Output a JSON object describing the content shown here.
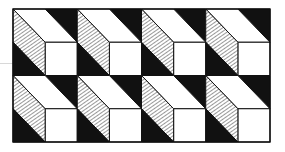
{
  "figure": {
    "grid": {
      "rows": 2,
      "cols": 4,
      "origin_x": 13,
      "origin_y": 9,
      "cell_width": 64.25,
      "cell_height": 66.5
    },
    "colors": {
      "background": "#ffffff",
      "ink": "#111111",
      "face": "#ffffff",
      "hatch": "#444444",
      "faint_line": "#d8d8d8"
    }
  }
}
